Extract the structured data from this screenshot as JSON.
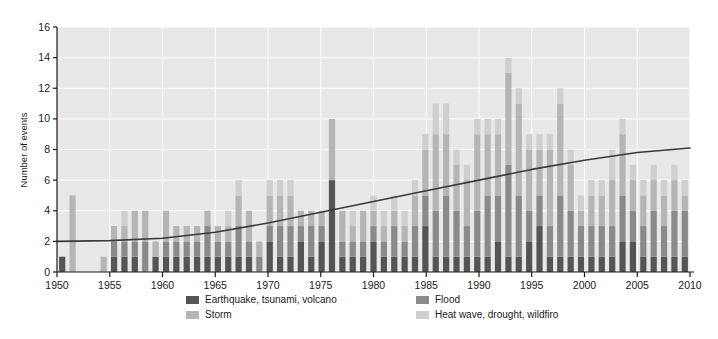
{
  "chart_data": {
    "type": "bar",
    "stacked": true,
    "title": "",
    "xlabel": "",
    "ylabel": "Number of events",
    "ylim": [
      0,
      16
    ],
    "ytick_step": 2,
    "yticks": [
      0,
      2,
      4,
      6,
      8,
      10,
      12,
      14,
      16
    ],
    "xlim": [
      1950,
      2010
    ],
    "xticks": [
      1950,
      1955,
      1960,
      1965,
      1970,
      1975,
      1980,
      1985,
      1990,
      1995,
      2000,
      2005,
      2010
    ],
    "grid": true,
    "grid_color": "#ffffff",
    "plot_background": "#e8e8e8",
    "legend_position": "bottom",
    "x": [
      1950,
      1951,
      1952,
      1953,
      1954,
      1955,
      1956,
      1957,
      1958,
      1959,
      1960,
      1961,
      1962,
      1963,
      1964,
      1965,
      1966,
      1967,
      1968,
      1969,
      1970,
      1971,
      1972,
      1973,
      1974,
      1975,
      1976,
      1977,
      1978,
      1979,
      1980,
      1981,
      1982,
      1983,
      1984,
      1985,
      1986,
      1987,
      1988,
      1989,
      1990,
      1991,
      1992,
      1993,
      1994,
      1995,
      1996,
      1997,
      1998,
      1999,
      2000,
      2001,
      2002,
      2003,
      2004,
      2005,
      2006,
      2007,
      2008,
      2009,
      2010
    ],
    "series": [
      {
        "name": "Earthquake, tsunami, volcano",
        "color": "#555555",
        "values": [
          1,
          0,
          0,
          0,
          0,
          1,
          1,
          1,
          0,
          1,
          1,
          1,
          1,
          1,
          1,
          1,
          1,
          1,
          1,
          0,
          2,
          1,
          1,
          2,
          1,
          2,
          6,
          1,
          1,
          1,
          2,
          1,
          1,
          1,
          1,
          3,
          1,
          1,
          1,
          1,
          1,
          1,
          2,
          1,
          1,
          2,
          3,
          1,
          1,
          1,
          1,
          1,
          1,
          1,
          2,
          2,
          1,
          1,
          1,
          1,
          1
        ]
      },
      {
        "name": "Flood",
        "color": "#8a8a8a",
        "values": [
          0,
          0,
          0,
          0,
          0,
          1,
          1,
          1,
          2,
          0,
          1,
          1,
          1,
          1,
          2,
          1,
          1,
          2,
          1,
          1,
          1,
          2,
          2,
          1,
          2,
          1,
          0,
          1,
          1,
          1,
          1,
          1,
          2,
          1,
          2,
          2,
          3,
          4,
          3,
          2,
          3,
          4,
          3,
          6,
          4,
          2,
          2,
          2,
          4,
          3,
          2,
          2,
          2,
          2,
          3,
          2,
          2,
          3,
          2,
          3,
          3
        ]
      },
      {
        "name": "Storm",
        "color": "#b5b5b5",
        "values": [
          0,
          5,
          0,
          0,
          1,
          1,
          1,
          2,
          2,
          1,
          2,
          1,
          1,
          1,
          1,
          1,
          1,
          2,
          2,
          1,
          2,
          2,
          2,
          1,
          1,
          1,
          4,
          2,
          1,
          2,
          1,
          1,
          1,
          1,
          2,
          3,
          5,
          4,
          3,
          3,
          5,
          4,
          4,
          6,
          6,
          4,
          3,
          5,
          6,
          3,
          1,
          2,
          2,
          3,
          4,
          2,
          2,
          2,
          2,
          2,
          1
        ]
      },
      {
        "name": "Heat wave, drought, wildfire",
        "color": "#cfcfcf",
        "values": [
          0,
          0,
          0,
          0,
          0,
          0,
          1,
          0,
          0,
          0,
          0,
          0,
          0,
          0,
          0,
          0,
          1,
          1,
          0,
          0,
          1,
          1,
          1,
          0,
          0,
          0,
          0,
          0,
          1,
          0,
          1,
          1,
          1,
          1,
          1,
          1,
          2,
          2,
          1,
          1,
          1,
          1,
          1,
          1,
          1,
          1,
          1,
          1,
          1,
          1,
          1,
          1,
          1,
          2,
          1,
          1,
          1,
          1,
          1,
          1,
          1
        ]
      }
    ],
    "trendline": {
      "name": "trend",
      "color": "#3a3a3a",
      "x": [
        1950,
        1955,
        1960,
        1965,
        1970,
        1975,
        1980,
        1985,
        1990,
        1995,
        2000,
        2005,
        2010
      ],
      "y": [
        2.0,
        2.05,
        2.2,
        2.6,
        3.2,
        3.9,
        4.6,
        5.3,
        6.0,
        6.7,
        7.3,
        7.8,
        8.1
      ]
    }
  },
  "legend": {
    "items": [
      {
        "label": "Earthquake, tsunami, volcano",
        "color": "#555555"
      },
      {
        "label": "Flood",
        "color": "#8a8a8a"
      },
      {
        "label": "Storm",
        "color": "#b5b5b5"
      },
      {
        "label": "Heat wave, drought, wildfiro",
        "color": "#cfcfcf"
      }
    ]
  }
}
